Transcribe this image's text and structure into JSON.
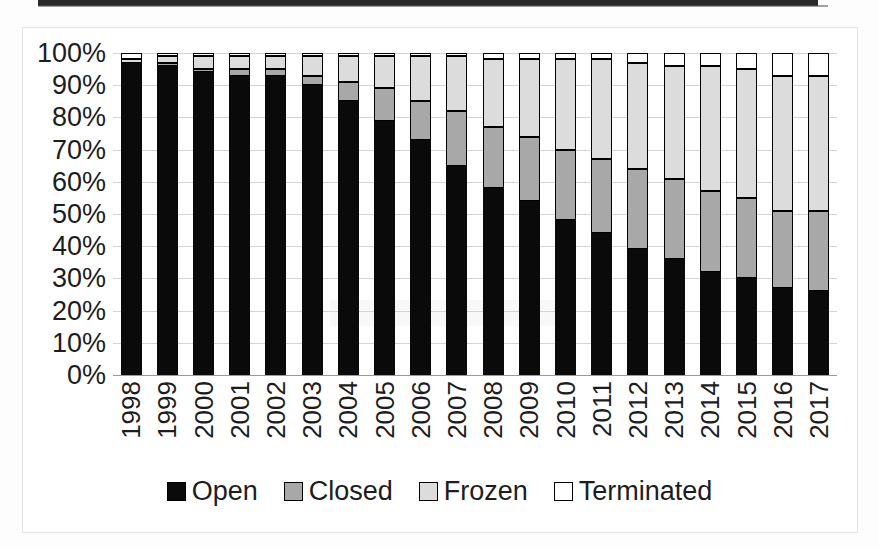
{
  "chart_data": {
    "type": "bar",
    "stacked": true,
    "stack_mode": "percent",
    "title": "",
    "subtitle": "",
    "xlabel": "",
    "ylabel": "",
    "ylim": [
      0,
      100
    ],
    "yticks": [
      "0%",
      "10%",
      "20%",
      "30%",
      "40%",
      "50%",
      "60%",
      "70%",
      "80%",
      "90%",
      "100%"
    ],
    "ytick_values": [
      0,
      10,
      20,
      30,
      40,
      50,
      60,
      70,
      80,
      90,
      100
    ],
    "grid": true,
    "grid_axis": "y",
    "legend_position": "bottom",
    "categories": [
      "1998",
      "1999",
      "2000",
      "2001",
      "2002",
      "2003",
      "2004",
      "2005",
      "2006",
      "2007",
      "2008",
      "2009",
      "2010",
      "2011",
      "2012",
      "2013",
      "2014",
      "2015",
      "2016",
      "2017"
    ],
    "series": [
      {
        "name": "Open",
        "color": "#0a0a0a",
        "values": [
          97,
          96,
          94,
          93,
          93,
          90,
          85,
          79,
          73,
          65,
          58,
          54,
          48,
          44,
          39,
          36,
          32,
          30,
          27,
          26
        ]
      },
      {
        "name": "Closed",
        "color": "#a8a8a8",
        "values": [
          0,
          1,
          1,
          2,
          2,
          3,
          6,
          10,
          12,
          17,
          19,
          20,
          22,
          23,
          25,
          25,
          25,
          25,
          24,
          25
        ]
      },
      {
        "name": "Frozen",
        "color": "#dcdcdc",
        "values": [
          1,
          2,
          4,
          4,
          4,
          6,
          8,
          10,
          14,
          17,
          21,
          24,
          28,
          31,
          33,
          35,
          39,
          40,
          42,
          42
        ]
      },
      {
        "name": "Terminated",
        "color": "#ffffff",
        "values": [
          2,
          1,
          1,
          1,
          1,
          1,
          1,
          1,
          1,
          1,
          2,
          2,
          2,
          2,
          3,
          4,
          4,
          5,
          7,
          7
        ]
      }
    ]
  },
  "legend": {
    "items": [
      {
        "label": "Open",
        "swatch": "open"
      },
      {
        "label": "Closed",
        "swatch": "closed"
      },
      {
        "label": "Frozen",
        "swatch": "frozen"
      },
      {
        "label": "Terminated",
        "swatch": "terminated"
      }
    ]
  }
}
